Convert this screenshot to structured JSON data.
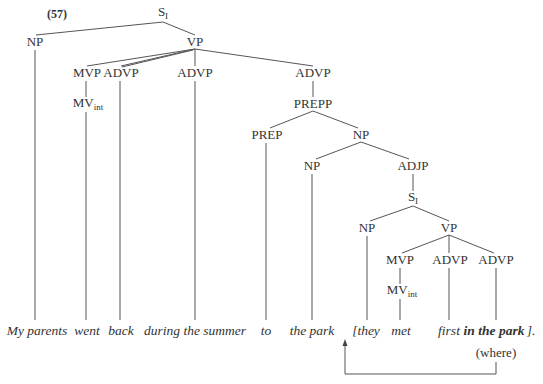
{
  "example_number": "(57)",
  "nodes": {
    "root": {
      "label": "S",
      "sub": "I"
    },
    "np_subject": {
      "label": "NP"
    },
    "vp_main": {
      "label": "VP"
    },
    "mvp_main": {
      "label": "MVP"
    },
    "advp_back": {
      "label": "ADVP"
    },
    "advp_during": {
      "label": "ADVP"
    },
    "advp_to": {
      "label": "ADVP"
    },
    "mv_main": {
      "label": "MV",
      "sub": "int"
    },
    "prepp": {
      "label": "PREPP"
    },
    "prep": {
      "label": "PREP"
    },
    "np_obj": {
      "label": "NP"
    },
    "np_park": {
      "label": "NP"
    },
    "adjp": {
      "label": "ADJP"
    },
    "s_rel": {
      "label": "S",
      "sub": "I"
    },
    "np_they": {
      "label": "NP"
    },
    "vp_rel": {
      "label": "VP"
    },
    "mvp_rel": {
      "label": "MVP"
    },
    "advp_first": {
      "label": "ADVP"
    },
    "advp_inpark": {
      "label": "ADVP"
    },
    "mv_rel": {
      "label": "MV",
      "sub": "int"
    }
  },
  "words": [
    {
      "text": "My parents",
      "bold": false
    },
    {
      "text": "went",
      "bold": false
    },
    {
      "text": "back",
      "bold": false
    },
    {
      "text": "during the summer",
      "bold": false
    },
    {
      "text": "to",
      "bold": false
    },
    {
      "text": "the park",
      "bold": false
    },
    {
      "text": "[they",
      "bold": false
    },
    {
      "text": "met",
      "bold": false
    },
    {
      "text": "first",
      "bold": false
    },
    {
      "text": "in the park",
      "bold": true
    },
    {
      "text": "].",
      "bold": false
    }
  ],
  "annotation": "(where)",
  "arrow": {
    "description": "arrow from 'in the park' back to '[they'"
  }
}
